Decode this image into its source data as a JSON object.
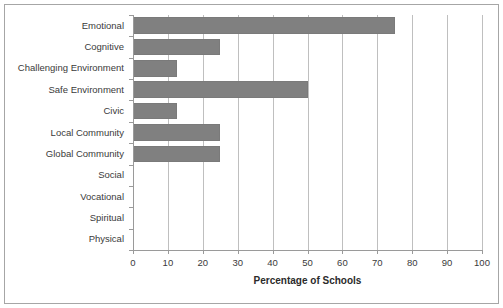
{
  "figure": {
    "cropped_title_text": "",
    "bar_color": "#808080",
    "gridline_color": "#bfbfbf",
    "axis_color": "#9a9a9a",
    "frame_color": "#a6a6a6",
    "background": "#ffffff"
  },
  "chart_data": {
    "type": "bar",
    "orientation": "horizontal",
    "title": "",
    "xlabel": "Percentage of Schools",
    "ylabel": "",
    "xlim": [
      0,
      100
    ],
    "xticks": [
      0,
      10,
      20,
      30,
      40,
      50,
      60,
      70,
      80,
      90,
      100
    ],
    "xtick_labels": [
      "0",
      "10",
      "20",
      "30",
      "40",
      "50",
      "60",
      "70",
      "80",
      "90",
      "100"
    ],
    "grid": "vertical",
    "legend": "none",
    "categories": [
      "Emotional",
      "Cognitive",
      "Challenging Environment",
      "Safe Environment",
      "Civic",
      "Local Community",
      "Global Community",
      "Social",
      "Vocational",
      "Spiritual",
      "Physical"
    ],
    "values": [
      75,
      25,
      12.5,
      50,
      12.5,
      25,
      25,
      0,
      0,
      0,
      0
    ]
  }
}
